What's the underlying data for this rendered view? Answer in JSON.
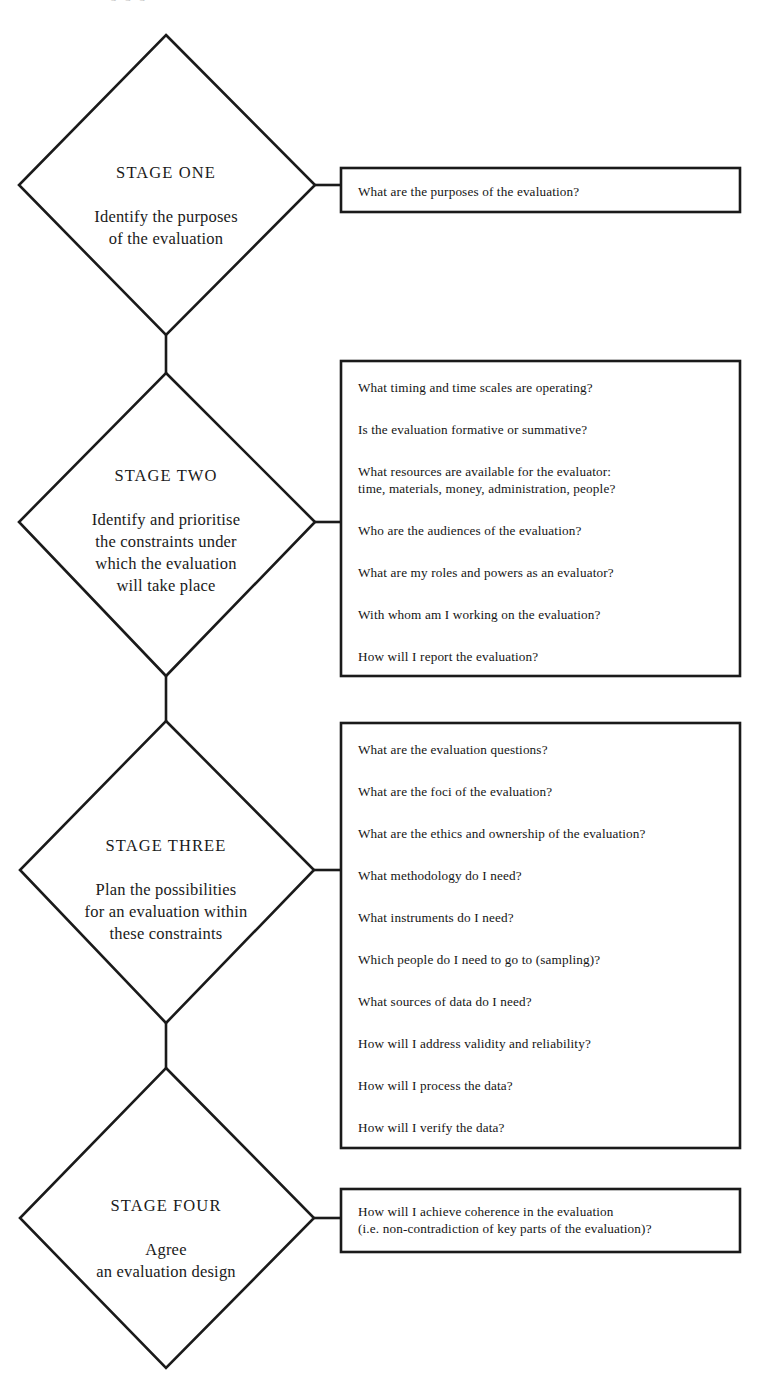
{
  "diagram": {
    "title_fragment": "a a a",
    "stages": [
      {
        "id": "stage-one",
        "title": "STAGE ONE",
        "description": "Identify the purposes\nof the evaluation",
        "questions": [
          "What are the purposes of the evaluation?"
        ]
      },
      {
        "id": "stage-two",
        "title": "STAGE TWO",
        "description": "Identify and prioritise\nthe constraints under\nwhich the evaluation\nwill take place",
        "questions": [
          "What timing and time scales are operating?",
          "Is the evaluation formative or summative?",
          "What resources are available for the evaluator:\ntime, materials, money, administration, people?",
          "Who are the audiences of the evaluation?",
          "What are my roles and powers as an evaluator?",
          "With whom am I working on the evaluation?",
          "How will I report the evaluation?"
        ]
      },
      {
        "id": "stage-three",
        "title": "STAGE THREE",
        "description": "Plan the possibilities\nfor an evaluation within\nthese constraints",
        "questions": [
          "What are the evaluation questions?",
          "What are the foci of the evaluation?",
          "What are the ethics and ownership of the evaluation?",
          "What methodology do I need?",
          "What instruments do I need?",
          "Which people do I need to go to (sampling)?",
          "What sources of data do I need?",
          "How will I address validity and reliability?",
          "How will I process the data?",
          "How will I verify the data?"
        ]
      },
      {
        "id": "stage-four",
        "title": "STAGE FOUR",
        "description": "Agree\nan evaluation design",
        "questions": [
          "How will I achieve coherence in the evaluation\n(i.e. non-contradiction of key parts of the evaluation)?"
        ]
      }
    ],
    "colors": {
      "line": "#1a1a1a",
      "text": "#141414",
      "background": "#ffffff"
    }
  }
}
